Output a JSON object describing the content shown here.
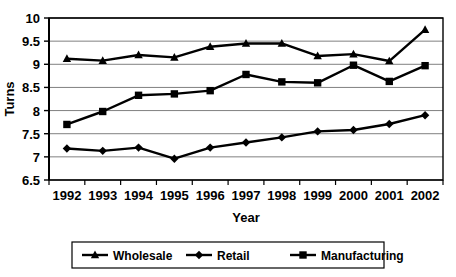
{
  "chart_data": {
    "type": "line",
    "title": "",
    "xlabel": "Year",
    "ylabel": "Turns",
    "categories": [
      "1992",
      "1993",
      "1994",
      "1995",
      "1996",
      "1997",
      "1998",
      "1999",
      "2000",
      "2001",
      "2002"
    ],
    "x": [
      1992,
      1993,
      1994,
      1995,
      1996,
      1997,
      1998,
      1999,
      2000,
      2001,
      2002
    ],
    "ylim": [
      6.5,
      10.0
    ],
    "yticks": [
      6.5,
      7.0,
      7.5,
      8.0,
      8.5,
      9.0,
      9.5,
      10.0
    ],
    "ytick_labels": [
      "6.5",
      "7",
      "7.5",
      "8",
      "8.5",
      "9",
      "9.5",
      "10"
    ],
    "grid": "horizontal",
    "legend_position": "bottom",
    "series": [
      {
        "name": "Wholesale",
        "marker": "triangle",
        "color": "#000000",
        "values": [
          9.12,
          9.08,
          9.2,
          9.15,
          9.38,
          9.45,
          9.45,
          9.18,
          9.22,
          9.07,
          9.75
        ]
      },
      {
        "name": "Retail",
        "marker": "diamond",
        "color": "#000000",
        "values": [
          7.18,
          7.13,
          7.2,
          6.96,
          7.2,
          7.31,
          7.42,
          7.55,
          7.58,
          7.71,
          7.9
        ]
      },
      {
        "name": "Manufacturing",
        "marker": "square",
        "color": "#000000",
        "values": [
          7.7,
          7.98,
          8.33,
          8.36,
          8.43,
          8.78,
          8.62,
          8.6,
          8.98,
          8.63,
          8.97
        ]
      }
    ]
  },
  "legend": {
    "items": [
      {
        "label": "Wholesale",
        "marker": "triangle"
      },
      {
        "label": "Retail",
        "marker": "diamond"
      },
      {
        "label": "Manufacturing",
        "marker": "square"
      }
    ]
  },
  "axes": {
    "x_title": "Year",
    "y_title": "Turns"
  },
  "colors": {
    "line": "#000000",
    "grid": "#808080",
    "axis": "#000000",
    "background": "#ffffff"
  }
}
